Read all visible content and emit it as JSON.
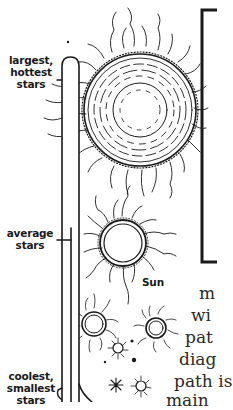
{
  "figure": {
    "thermometer_labels": {
      "top": [
        "largest,",
        "hottest",
        "stars"
      ],
      "middle": [
        "average",
        "stars"
      ],
      "bottom": [
        "coolest,",
        "smallest",
        "stars"
      ]
    },
    "sun_label": "Sun",
    "colors": {
      "ink": "#1a1a1a",
      "background": "#ffffff"
    }
  },
  "body_text": {
    "lines": [
      "m",
      "wi",
      "pat",
      "diag",
      "path is",
      "main"
    ]
  }
}
